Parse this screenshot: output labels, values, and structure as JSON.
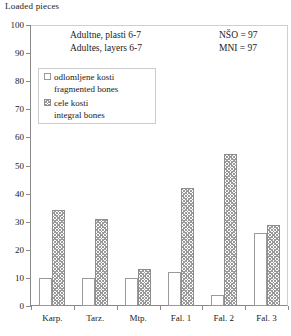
{
  "chart_data": {
    "type": "bar",
    "title": "Loaded pieces",
    "xlabel": "",
    "ylabel": "Loaded pieces",
    "ylim": [
      0,
      100
    ],
    "ytick_step": 10,
    "yticks": [
      0,
      10,
      20,
      30,
      40,
      50,
      60,
      70,
      80,
      90,
      100
    ],
    "grid": false,
    "legend_position": "upper-left-inside",
    "categories": [
      "Karp.",
      "Tarz.",
      "Mtp.",
      "Fal. 1",
      "Fal. 2",
      "Fal. 3"
    ],
    "series": [
      {
        "name": "odlomljene kosti / fragmented bones",
        "fill": "white-outline",
        "values": [
          10,
          10,
          10,
          12,
          4,
          26
        ]
      },
      {
        "name": "cele kosti / integral bones",
        "fill": "hatched-grey",
        "values": [
          34,
          31,
          13,
          42,
          54,
          29
        ]
      }
    ],
    "annotations": [
      "Adultne, plasti 6-7",
      "Adultes, layers 6-7",
      "NŠO = 97",
      "MNI = 97"
    ]
  },
  "axis": {
    "y_title": "Loaded pieces",
    "y_labels": [
      "100",
      "90",
      "80",
      "70",
      "60",
      "50",
      "40",
      "30",
      "20",
      "10",
      "0"
    ],
    "x_labels": [
      "Karp.",
      "Tarz.",
      "Mtp.",
      "Fal. 1",
      "Fal. 2",
      "Fal. 3"
    ]
  },
  "annotations": {
    "line1": "Adultne, plasti 6-7",
    "line2": "Adultes, layers 6-7",
    "nso": "NŠO = 97",
    "mni": "MNI = 97"
  },
  "legend": {
    "items": [
      {
        "swatch": "white-outline-swatch",
        "label": "odlomljene kosti",
        "sublabel": "fragmented bones"
      },
      {
        "swatch": "hatched-grey-swatch",
        "label": "cele kosti",
        "sublabel": "integral bones"
      }
    ]
  },
  "colors": {
    "axis": "#8a8a8a",
    "hatch": "#9a9a9a",
    "text": "#1a1a1a",
    "background": "#ffffff"
  }
}
